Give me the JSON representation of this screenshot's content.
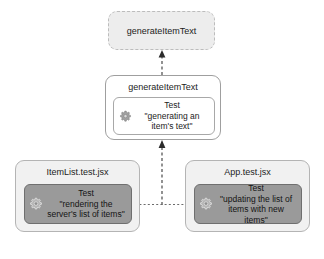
{
  "diagram": {
    "colors": {
      "page_background": "#ffffff",
      "node_fill": "#f1f1f1",
      "ghost_node_fill": "#ededed",
      "node_border": "#b4b4b4",
      "test_card_light_fill": "#ffffff",
      "test_card_dark_fill": "#9a9a9a",
      "connector": "#4a4a4a",
      "text": "#1c1c1c"
    }
  },
  "nodes": {
    "module": {
      "title": "generateItemText",
      "style": "ghost"
    },
    "unit_suite": {
      "title": "generateItemText",
      "style": "plain",
      "test": {
        "icon": "gear-icon",
        "label": "Test",
        "description": "\"generating an\nitem's text\""
      }
    },
    "item_list_suite": {
      "title": "ItemList.test.jsx",
      "style": "filled",
      "test": {
        "icon": "gear-icon",
        "label": "Test",
        "description": "\"rendering the\nserver's list of items\""
      }
    },
    "app_suite": {
      "title": "App.test.jsx",
      "style": "filled",
      "test": {
        "icon": "gear-icon",
        "label": "Test",
        "description": "\"updating the list of\nitems with new items\""
      }
    }
  },
  "connectors": [
    {
      "name": "unit-suite-to-module",
      "from": "unit_suite",
      "to": "module",
      "style": "dashed",
      "arrow": "up"
    },
    {
      "name": "integration-to-unit-suite",
      "from": "item_list_suite",
      "to": "unit_suite",
      "style": "dashed",
      "arrow": "up"
    },
    {
      "name": "item-list-to-app",
      "from": "item_list_suite",
      "to": "app_suite",
      "style": "dotted",
      "arrow": "none"
    }
  ]
}
